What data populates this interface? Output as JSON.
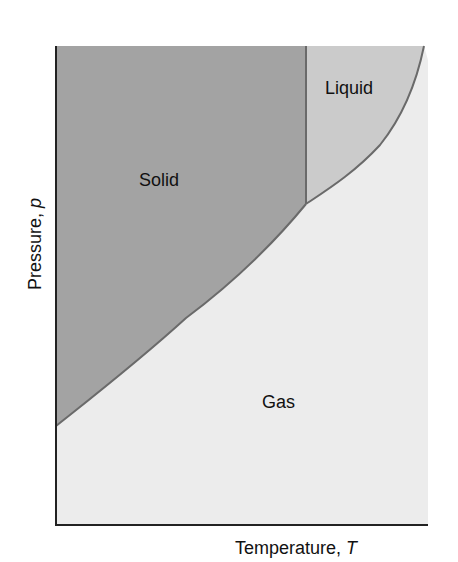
{
  "diagram": {
    "type": "phase-diagram",
    "regions": {
      "solid": {
        "label": "Solid",
        "color": "#a3a3a3"
      },
      "liquid": {
        "label": "Liquid",
        "color": "#cbcbcb"
      },
      "gas": {
        "label": "Gas",
        "color": "#ececec"
      }
    },
    "boundary_color": "#6a6a6a",
    "axis_color": "#222222",
    "axes": {
      "x": {
        "label": "Temperature, ",
        "symbol": "T"
      },
      "y": {
        "label": "Pressure, ",
        "symbol": "p"
      }
    }
  }
}
